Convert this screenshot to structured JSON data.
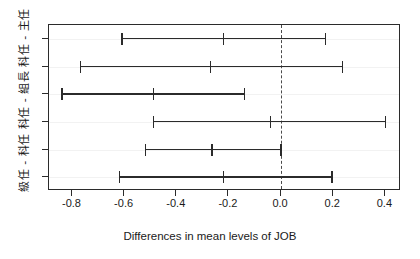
{
  "plot": {
    "y_axis_label": "級任 - 科任  科任 - 組長  科任 - 主任",
    "x_axis_title": "Differences in mean levels of JOB",
    "zero_reference": "0.0"
  },
  "axis": {
    "x_tick_labels": [
      "-0.8",
      "-0.6",
      "-0.4",
      "-0.2",
      "0.0",
      "0.2",
      "0.4"
    ],
    "x_tick_values": [
      -0.8,
      -0.6,
      -0.4,
      -0.2,
      0.0,
      0.2,
      0.4
    ]
  },
  "chart_data": {
    "type": "scatter",
    "title": "",
    "subtitle": "",
    "xlabel": "Differences in mean levels of JOB",
    "ylabel": "級任 - 科任  科任 - 組長  科任 - 主任",
    "xlim": [
      -0.89,
      0.46
    ],
    "ylim": [
      0,
      6
    ],
    "grid": false,
    "legend": "none",
    "xticks": [
      -0.8,
      -0.6,
      -0.4,
      -0.2,
      0.0,
      0.2,
      0.4
    ],
    "xticklabels": [
      "-0.8",
      "-0.6",
      "-0.4",
      "-0.2",
      "0.0",
      "0.2",
      "0.4"
    ],
    "reference_line": {
      "x": 0.0,
      "style": "dashed"
    },
    "categories": [
      "科任 - 主任",
      "組長 - 主任",
      "級任 - 主任",
      "組長 - 科任",
      "級任 - 科任",
      "級任 - 組長"
    ],
    "series": [
      {
        "name": "Tukey HSD 95% family-wise confidence intervals",
        "estimates": [
          -0.22,
          -0.27,
          -0.49,
          -0.04,
          -0.265,
          -0.22
        ],
        "lower": [
          -0.61,
          -0.77,
          -0.84,
          -0.49,
          -0.52,
          -0.62
        ],
        "upper": [
          0.17,
          0.235,
          -0.14,
          0.4,
          0.0,
          0.195
        ]
      }
    ],
    "intervals": [
      {
        "row": 1,
        "lower": -0.61,
        "estimate": -0.22,
        "upper": 0.17
      },
      {
        "row": 2,
        "lower": -0.77,
        "estimate": -0.27,
        "upper": 0.235
      },
      {
        "row": 3,
        "lower": -0.84,
        "estimate": -0.49,
        "upper": -0.14
      },
      {
        "row": 4,
        "lower": -0.49,
        "estimate": -0.04,
        "upper": 0.4
      },
      {
        "row": 5,
        "lower": -0.52,
        "estimate": -0.265,
        "upper": 0.0
      },
      {
        "row": 6,
        "lower": -0.62,
        "estimate": -0.22,
        "upper": 0.195
      }
    ]
  },
  "colors": {
    "line": "#2b2b2b",
    "reference": "#4a4a4a",
    "background": "#ffffff",
    "grid": "#f2f2f2"
  }
}
